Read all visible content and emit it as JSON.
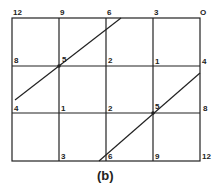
{
  "caption": "(b)",
  "grid": {
    "columns": 4,
    "rows": 3,
    "line_color": "#222222"
  },
  "labels": {
    "top": [
      "12",
      "9",
      "6",
      "3",
      "O"
    ],
    "row1": [
      "8",
      "5",
      "2",
      "1",
      "4"
    ],
    "row2": [
      "4",
      "1",
      "2",
      "5",
      "8"
    ],
    "bottom": [
      "3",
      "6",
      "9",
      "12"
    ]
  }
}
